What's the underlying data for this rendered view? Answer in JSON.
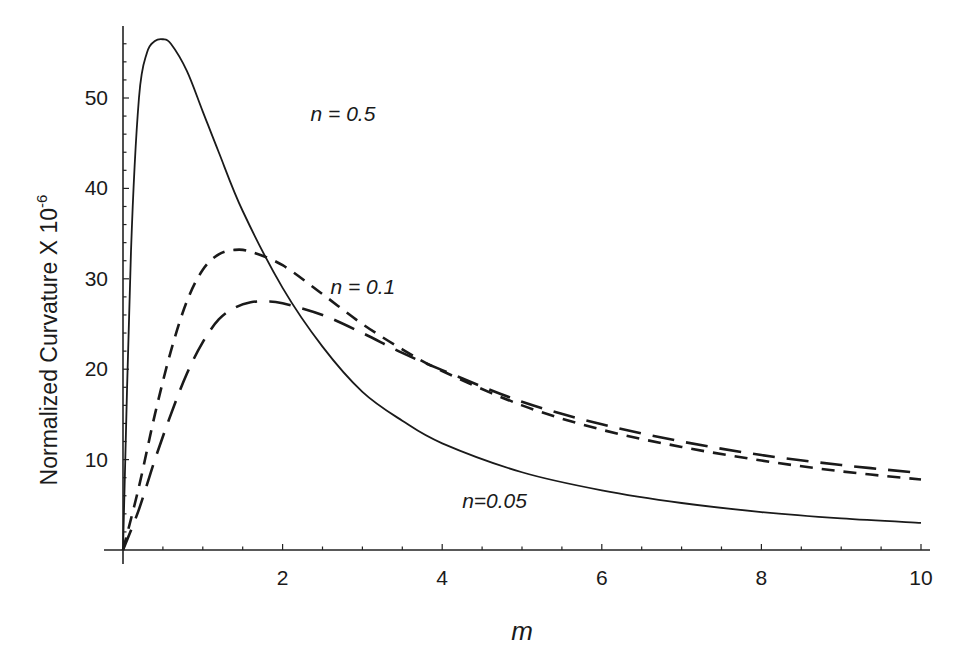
{
  "chart_data": {
    "type": "line",
    "title": "",
    "xlabel": "m",
    "ylabel": "Normalized Curvature X 10",
    "ylabel_exponent": "-6",
    "xlim": [
      0,
      10
    ],
    "ylim": [
      0,
      57
    ],
    "x_ticks": [
      2,
      4,
      6,
      8,
      10
    ],
    "y_ticks": [
      10,
      20,
      30,
      40,
      50
    ],
    "x_tick_labels": [
      "2",
      "4",
      "6",
      "8",
      "10"
    ],
    "y_tick_labels": [
      "10",
      "20",
      "30",
      "40",
      "50"
    ],
    "grid": false,
    "legend": "inline annotations",
    "series": [
      {
        "name": "n = 0.5",
        "style": "solid",
        "x": [
          0,
          0.1,
          0.2,
          0.3,
          0.4,
          0.5,
          0.6,
          0.8,
          1.0,
          1.2,
          1.5,
          2.0,
          2.5,
          3.0,
          3.5,
          4.0,
          5.0,
          6.0,
          7.0,
          8.0,
          9.0,
          10.0
        ],
        "values": [
          0,
          33,
          50,
          55,
          56.3,
          56.5,
          56.0,
          53.0,
          48.5,
          44,
          37.5,
          29,
          22.5,
          17.5,
          14.3,
          11.8,
          8.6,
          6.6,
          5.2,
          4.2,
          3.5,
          3.0
        ]
      },
      {
        "name": "n = 0.1",
        "style": "short-dash",
        "x": [
          0,
          0.2,
          0.4,
          0.6,
          0.8,
          1.0,
          1.2,
          1.4,
          1.6,
          2.0,
          2.5,
          3.0,
          3.5,
          4.0,
          5.0,
          6.0,
          7.0,
          8.0,
          9.0,
          10.0
        ],
        "values": [
          0,
          7,
          15,
          22,
          27.5,
          31,
          32.7,
          33.2,
          33,
          31.5,
          28.3,
          25,
          22.2,
          19.8,
          16,
          13.3,
          11.4,
          9.9,
          8.7,
          7.8
        ]
      },
      {
        "name": "n = 0.05",
        "style": "long-dash",
        "x": [
          0,
          0.2,
          0.4,
          0.6,
          0.8,
          1.0,
          1.2,
          1.4,
          1.6,
          1.8,
          2.0,
          2.5,
          3.0,
          3.5,
          4.0,
          5.0,
          6.0,
          7.0,
          8.0,
          9.0,
          10.0
        ],
        "values": [
          0,
          4.5,
          10,
          15,
          19.5,
          23,
          25.5,
          26.8,
          27.4,
          27.5,
          27.3,
          26,
          24,
          21.8,
          19.9,
          16.4,
          13.9,
          12,
          10.5,
          9.4,
          8.5
        ]
      }
    ],
    "annotations": [
      {
        "text": "n = 0.5",
        "x": 2.35,
        "y": 47.5
      },
      {
        "text": "n = 0.1",
        "x": 2.6,
        "y": 28.3
      },
      {
        "text": "n=0.05",
        "x": 4.25,
        "y": 4.7
      }
    ]
  }
}
